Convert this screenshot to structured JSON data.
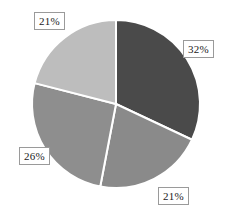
{
  "chart_data": {
    "type": "pie",
    "title": "",
    "subtitle": "",
    "xlabel": "",
    "ylabel": "",
    "grid": false,
    "legend_position": "none",
    "labels_format": "percent",
    "total": 100,
    "center": {
      "x": 116,
      "y": 104
    },
    "radius": 84,
    "start_angle_deg": 0,
    "direction": "clockwise",
    "separator_color": "#ffffff",
    "background_color": "#ffffff",
    "categories": [
      "Slice 1",
      "Slice 2",
      "Slice 3",
      "Slice 4"
    ],
    "values": [
      32,
      21,
      26,
      21
    ],
    "slices": [
      {
        "label": "32%",
        "value": 32,
        "color": "#4a4a4a",
        "start_angle_deg": 0,
        "end_angle_deg": 115.2,
        "label_position": "right"
      },
      {
        "label": "21%",
        "value": 21,
        "color": "#8a8a8a",
        "start_angle_deg": 115.2,
        "end_angle_deg": 190.8,
        "label_position": "bottom-right"
      },
      {
        "label": "26%",
        "value": 26,
        "color": "#8e8e8e",
        "start_angle_deg": 190.8,
        "end_angle_deg": 284.4,
        "label_position": "left"
      },
      {
        "label": "21%",
        "value": 21,
        "color": "#bdbdbd",
        "start_angle_deg": 284.4,
        "end_angle_deg": 360,
        "label_position": "top-left"
      }
    ]
  }
}
